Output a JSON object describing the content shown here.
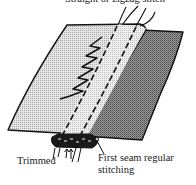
{
  "figure": {
    "labels": {
      "top": "Straight or zigzag stitch",
      "trimmed": "Trimmed",
      "first_seam_line1": "First seam regular",
      "first_seam_line2": "stitching"
    },
    "colors": {
      "outline": "#111111",
      "light_fabric": "#d4d4d4",
      "dark_fabric": "#8a8a8a",
      "seam_strip": "#e2e2e2",
      "text": "#222222"
    }
  }
}
